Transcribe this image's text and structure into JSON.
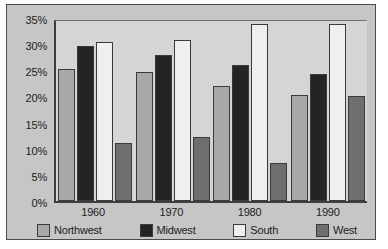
{
  "chart_data": {
    "type": "bar",
    "title": "",
    "xlabel": "",
    "ylabel": "",
    "categories": [
      "1960",
      "1970",
      "1980",
      "1990"
    ],
    "series": [
      {
        "name": "Northwest",
        "color": "#a9a9a9",
        "values": [
          25.2,
          24.6,
          22.0,
          20.2
        ]
      },
      {
        "name": "Midwest",
        "color": "#242424",
        "values": [
          29.6,
          28.0,
          26.1,
          24.2
        ]
      },
      {
        "name": "South",
        "color": "#efefef",
        "values": [
          30.5,
          30.8,
          33.8,
          33.9
        ]
      },
      {
        "name": "West",
        "color": "#6f6f6f",
        "values": [
          11.1,
          12.3,
          7.3,
          20.1
        ]
      }
    ],
    "ylim": [
      0,
      35
    ],
    "y_ticks": [
      "0%",
      "5%",
      "10%",
      "15%",
      "20%",
      "25%",
      "30%",
      "35%"
    ],
    "y_tick_values": [
      0,
      5,
      10,
      15,
      20,
      25,
      30,
      35
    ],
    "grid": false,
    "legend_position": "bottom"
  },
  "legend": {
    "items": [
      {
        "label": "Northwest"
      },
      {
        "label": "Midwest"
      },
      {
        "label": "South"
      },
      {
        "label": "West"
      }
    ]
  }
}
